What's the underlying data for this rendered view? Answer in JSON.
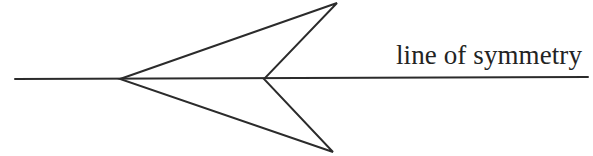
{
  "figure": {
    "kind": "geometry-diagram",
    "background_color": "#ffffff",
    "stroke_color": "#2b2b2b",
    "text_color": "#232323",
    "width": 593,
    "height": 156,
    "label": {
      "text": "line of symmetry",
      "x": 396,
      "y": 40,
      "font_size": 27
    },
    "axis": {
      "name": "line-of-symmetry",
      "x1": 15,
      "y1": 79,
      "x2": 588,
      "y2": 77
    },
    "dart": {
      "name": "concave-arrowhead-quadrilateral",
      "points": "120,79 337,3 264,79 333,152",
      "vertices": [
        {
          "name": "left-vertex",
          "x": 120,
          "y": 79
        },
        {
          "name": "top-tip-vertex",
          "x": 337,
          "y": 3
        },
        {
          "name": "notch-vertex",
          "x": 264,
          "y": 79
        },
        {
          "name": "bottom-tip-vertex",
          "x": 333,
          "y": 152
        }
      ]
    }
  }
}
